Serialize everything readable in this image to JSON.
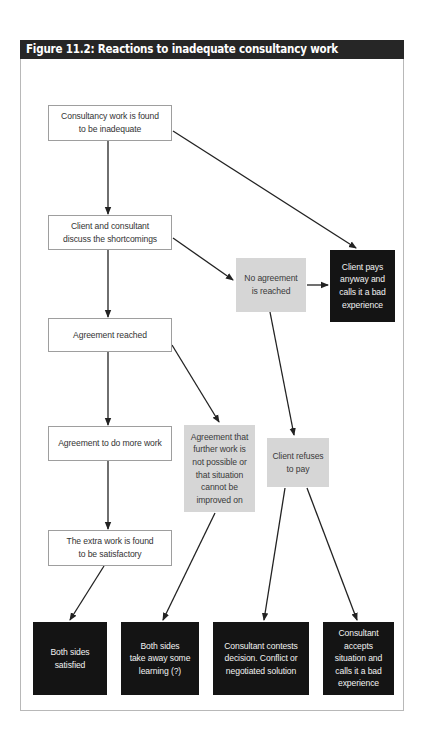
{
  "figure": {
    "title": "Figure 11.2: Reactions to inadequate consultancy work"
  },
  "nodes": {
    "inadequate": {
      "label": "Consultancy work is found\nto be inadequate",
      "style": "white"
    },
    "discuss": {
      "label": "Client and consultant\ndiscuss the shortcomings",
      "style": "white"
    },
    "agreement_reached": {
      "label": "Agreement reached",
      "style": "white"
    },
    "more_work": {
      "label": "Agreement to do more work",
      "style": "white"
    },
    "extra_satisfactory": {
      "label": "The extra work is found\nto be satisfactory",
      "style": "white"
    },
    "no_agreement": {
      "label": "No agreement\nis reached",
      "style": "grey"
    },
    "client_pays": {
      "label": "Client pays\nanyway and\ncalls it a bad\nexperience",
      "style": "black"
    },
    "not_possible": {
      "label": "Agreement that\nfurther work is\nnot possible or\nthat situation\ncannot be\nimproved on",
      "style": "grey"
    },
    "refuses_pay": {
      "label": "Client refuses\nto pay",
      "style": "grey"
    },
    "both_satisfied": {
      "label": "Both sides\nsatisfied",
      "style": "black"
    },
    "learning": {
      "label": "Both sides\ntake away some\nlearning (?)",
      "style": "black"
    },
    "contests": {
      "label": "Consultant contests\ndecision. Conflict or\nnegotiated solution",
      "style": "black"
    },
    "accepts": {
      "label": "Consultant\naccepts\nsituation and\ncalls it a bad\nexperience",
      "style": "black"
    }
  },
  "edges": [
    {
      "from": "inadequate",
      "to": "discuss"
    },
    {
      "from": "inadequate",
      "to": "client_pays"
    },
    {
      "from": "discuss",
      "to": "agreement_reached"
    },
    {
      "from": "discuss",
      "to": "no_agreement"
    },
    {
      "from": "no_agreement",
      "to": "client_pays"
    },
    {
      "from": "no_agreement",
      "to": "refuses_pay"
    },
    {
      "from": "agreement_reached",
      "to": "more_work"
    },
    {
      "from": "agreement_reached",
      "to": "not_possible"
    },
    {
      "from": "more_work",
      "to": "extra_satisfactory"
    },
    {
      "from": "extra_satisfactory",
      "to": "both_satisfied"
    },
    {
      "from": "not_possible",
      "to": "learning"
    },
    {
      "from": "refuses_pay",
      "to": "contests"
    },
    {
      "from": "refuses_pay",
      "to": "accepts"
    }
  ],
  "colors": {
    "title_bar": "#262626",
    "white_node_border": "#9e9e9e",
    "grey_node": "#d6d6d6",
    "black_node": "#141414",
    "arrow": "#222222"
  }
}
